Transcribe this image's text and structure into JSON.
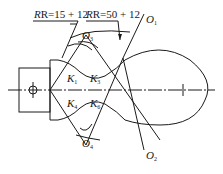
{
  "diagram": {
    "caption": "(a) 图示 (partially cropped)",
    "dimensions": [
      {
        "id": "r1",
        "text": "R=15 + 12"
      },
      {
        "id": "r2",
        "text": "R=50 + 12"
      }
    ],
    "points": [
      {
        "id": "O1",
        "letter": "O",
        "sub": "1"
      },
      {
        "id": "O2",
        "letter": "O",
        "sub": "2"
      },
      {
        "id": "O3",
        "letter": "O",
        "sub": "3"
      },
      {
        "id": "O4",
        "letter": "O",
        "sub": "4"
      },
      {
        "id": "K1",
        "letter": "K",
        "sub": "1"
      },
      {
        "id": "K3",
        "letter": "K",
        "sub": "3"
      },
      {
        "id": "K4",
        "letter": "K",
        "sub": "4"
      },
      {
        "id": "K6",
        "letter": "K",
        "sub": "6"
      }
    ],
    "line_color": "#1a1a1a"
  }
}
